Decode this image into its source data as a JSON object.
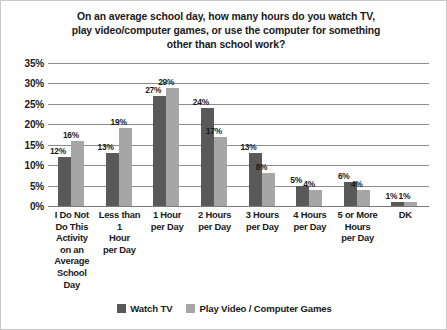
{
  "chart_data": {
    "type": "bar",
    "title": "On an average school day, how many hours do you watch TV, play video/computer games, or use the computer for something other than school work?",
    "title_lines": [
      "On an average school day, how many hours do you watch TV,",
      "play video/computer games, or use the computer for something",
      "other than school work?"
    ],
    "xlabel": "",
    "ylabel": "",
    "ylim": [
      0,
      35
    ],
    "ytick_labels": [
      "0%",
      "5%",
      "10%",
      "15%",
      "20%",
      "25%",
      "30%",
      "35%"
    ],
    "ytick_values": [
      0,
      5,
      10,
      15,
      20,
      25,
      30,
      35
    ],
    "grid": true,
    "legend_position": "bottom",
    "categories": [
      "I Do Not Do This Activity on an Average School Day",
      "Less than 1 Hour per Day",
      "1 Hour per Day",
      "2 Hours per Day",
      "3 Hours per Day",
      "4 Hours per Day",
      "5 or More Hours per Day",
      "DK"
    ],
    "category_lines": [
      [
        "I Do Not",
        "Do This",
        "Activity",
        "on an",
        "Average",
        "School",
        "Day"
      ],
      [
        "Less than 1",
        "Hour",
        "per Day"
      ],
      [
        "1 Hour",
        "per Day"
      ],
      [
        "2 Hours",
        "per Day"
      ],
      [
        "3 Hours",
        "per Day"
      ],
      [
        "4 Hours",
        "per Day"
      ],
      [
        "5 or More",
        "Hours",
        "per Day"
      ],
      [
        "DK"
      ]
    ],
    "series": [
      {
        "name": "Watch TV",
        "color": "#595959",
        "values": [
          12,
          13,
          27,
          24,
          13,
          5,
          6,
          1
        ],
        "labels": [
          "12%",
          "13%",
          "27%",
          "24%",
          "13%",
          "5%",
          "6%",
          "1%"
        ]
      },
      {
        "name": "Play Video / Computer Games",
        "color": "#a6a6a6",
        "values": [
          16,
          19,
          29,
          17,
          8,
          4,
          4,
          1
        ],
        "labels": [
          "16%",
          "19%",
          "29%",
          "17%",
          "8%",
          "4%",
          "4%",
          "1%"
        ]
      }
    ]
  },
  "legend": {
    "items": [
      {
        "label": "Watch TV",
        "color": "#595959"
      },
      {
        "label": "Play Video / Computer Games",
        "color": "#a6a6a6"
      }
    ]
  },
  "colors": {
    "series_watch_tv": "#595959",
    "series_play_video": "#a6a6a6",
    "gridline": "#8c8c8c",
    "text": "#1a1a1a",
    "frame_border": "#c9c9c9",
    "background": "#ffffff"
  }
}
